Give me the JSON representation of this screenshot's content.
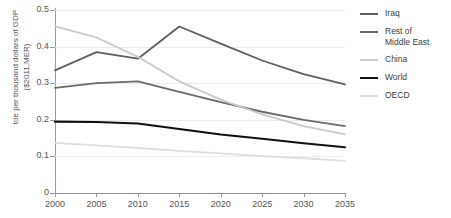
{
  "chart_data": {
    "type": "line",
    "title": "",
    "xlabel": "",
    "ylabel_line1": "toe per thousand dollars of GDP",
    "ylabel_line2": "($2011,MER)",
    "x": [
      2000,
      2005,
      2010,
      2015,
      2020,
      2025,
      2030,
      2035
    ],
    "xlim": [
      2000,
      2035
    ],
    "ylim": [
      0,
      0.5
    ],
    "xticks": [
      "2000",
      "2005",
      "2010",
      "2015",
      "2020",
      "2025",
      "2030",
      "2035"
    ],
    "yticks": [
      "0",
      "0.1",
      "0.2",
      "0.3",
      "0.4",
      "0.5"
    ],
    "ytick_values": [
      0,
      0.1,
      0.2,
      0.3,
      0.4,
      0.5
    ],
    "grid": "horizontal",
    "legend_position": "right",
    "series": [
      {
        "name": "Iraq",
        "color": "#5f5f5f",
        "width": 1.8,
        "values": [
          0.335,
          0.385,
          0.367,
          0.455,
          0.408,
          0.362,
          0.325,
          0.297
        ]
      },
      {
        "name": "Rest of Middle East",
        "color": "#6a6a6a",
        "width": 1.8,
        "values": [
          0.287,
          0.3,
          0.305,
          0.276,
          0.248,
          0.222,
          0.2,
          0.183
        ]
      },
      {
        "name": "China",
        "color": "#c9c9c9",
        "width": 1.8,
        "values": [
          0.455,
          0.425,
          0.372,
          0.305,
          0.255,
          0.215,
          0.183,
          0.16
        ]
      },
      {
        "name": "World",
        "color": "#101010",
        "width": 2.1,
        "values": [
          0.195,
          0.194,
          0.19,
          0.175,
          0.16,
          0.148,
          0.136,
          0.125
        ]
      },
      {
        "name": "OECD",
        "color": "#dcdcdc",
        "width": 1.8,
        "values": [
          0.137,
          0.13,
          0.123,
          0.115,
          0.108,
          0.101,
          0.095,
          0.088
        ]
      }
    ]
  },
  "legend": {
    "items": [
      {
        "label": "Iraq",
        "color": "#5f5f5f",
        "thickness": 2
      },
      {
        "label": "Rest of\nMiddle East",
        "color": "#6a6a6a",
        "thickness": 2
      },
      {
        "label": "China",
        "color": "#cdcdcd",
        "thickness": 2
      },
      {
        "label": "World",
        "color": "#101010",
        "thickness": 2.6
      },
      {
        "label": "OECD",
        "color": "#dddddd",
        "thickness": 2
      }
    ]
  }
}
